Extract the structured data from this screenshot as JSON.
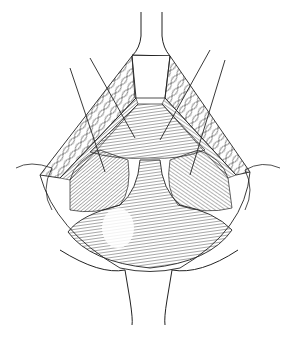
{
  "image": {
    "width": 294,
    "height": 340,
    "background": "#ffffff",
    "ink": "#1a1a1a",
    "style": "black-and-white pen-and-ink line illustration",
    "subject": "surgical illustration of an open incision held by retractors with traction sutures"
  },
  "elements": {
    "top_retractor": "retractor-blade-top",
    "bottom_retractor": "retractor-blade-bottom",
    "left_flap": "tissue-flap-left",
    "right_flap": "tissue-flap-right",
    "central_organ": "exposed-organ",
    "sutures": 4
  }
}
